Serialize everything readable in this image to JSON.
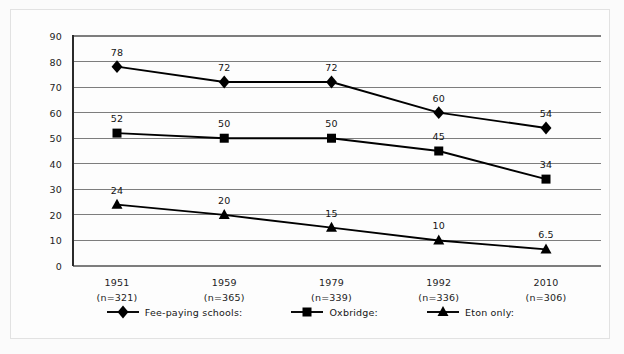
{
  "chart_data": {
    "type": "line",
    "title": "",
    "subtitle": "",
    "xlabel": "",
    "ylabel": "",
    "categories": [
      "1951",
      "1959",
      "1979",
      "1992",
      "2010"
    ],
    "category_sublabels": [
      "(n=321)",
      "(n=365)",
      "(n=339)",
      "(n=336)",
      "(n=306)"
    ],
    "ylim": [
      0,
      90
    ],
    "yticks": [
      "0",
      "10",
      "20",
      "30",
      "40",
      "50",
      "60",
      "70",
      "80",
      "90"
    ],
    "grid": true,
    "legend_position": "bottom",
    "series": [
      {
        "name": "Fee-paying schools:",
        "marker": "diamond",
        "color": "#000000",
        "values": [
          78,
          72,
          72,
          60,
          54
        ],
        "labels": [
          "78",
          "72",
          "72",
          "60",
          "54"
        ]
      },
      {
        "name": "Oxbridge:",
        "marker": "square",
        "color": "#000000",
        "values": [
          52,
          50,
          50,
          45,
          34
        ],
        "labels": [
          "52",
          "50",
          "50",
          "45",
          "34"
        ]
      },
      {
        "name": "Eton only:",
        "marker": "triangle",
        "color": "#000000",
        "values": [
          24,
          20,
          15,
          10,
          6.5
        ],
        "labels": [
          "24",
          "20",
          "15",
          "10",
          "6.5"
        ]
      }
    ]
  },
  "colors": {
    "background": "#fbfbfb",
    "plot_background": "#fdfdfd",
    "gridline": "#7d7d7d",
    "frame": "#e2e2e2",
    "series": "#000000",
    "text": "#1c1c1c"
  }
}
